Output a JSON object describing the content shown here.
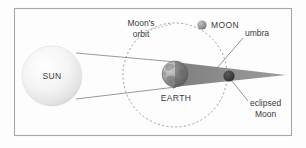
{
  "figure": {
    "background_color": "#fdfdfd",
    "frame_color": "#a8a8a8"
  },
  "labels": {
    "sun": "SUN",
    "earth": "EARTH",
    "moon": "MOON",
    "umbra": "umbra",
    "orbit_line1": "Moon's",
    "orbit_line2": "orbit",
    "eclipsed_line1": "eclipsed",
    "eclipsed_line2": "Moon"
  },
  "colors": {
    "sun_fill": "#f2f2f2",
    "sun_edge": "#d7d7d7",
    "earth_light": "#b9b9b9",
    "earth_dark": "#6d6d6d",
    "moon_fill": "#9a9a9a",
    "umbra_fill": "#8e8e8e",
    "eclipsed_moon_fill": "#3a3a3a",
    "ray_stroke": "#6f6f6f",
    "orbit_stroke": "#8a8a8a",
    "text_fill": "#3b3b3b"
  },
  "geometry": {
    "sun": {
      "cx": 52,
      "cy": 76,
      "r": 30
    },
    "earth": {
      "cx": 175,
      "cy": 74,
      "r": 13
    },
    "moon": {
      "cx": 202,
      "cy": 25,
      "r": 4.6
    },
    "eclipsed_moon": {
      "cx": 229,
      "cy": 76,
      "r": 5.6
    },
    "orbit": {
      "cx": 175,
      "cy": 75,
      "r": 52
    },
    "umbra_apex_x": 286,
    "frame": {
      "x": 14,
      "y": 8,
      "width": 278,
      "height": 128
    }
  }
}
